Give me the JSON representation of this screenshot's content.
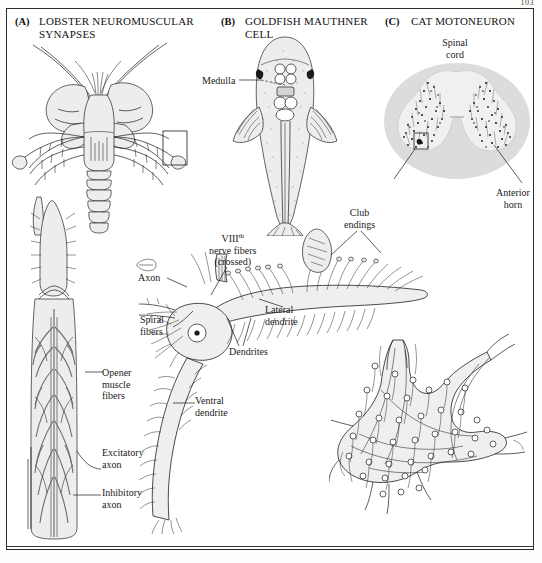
{
  "page": {
    "page_number": "103",
    "background_color": "#ffffff",
    "ink_color": "#1a1a1a"
  },
  "panels": [
    {
      "tag": "(A)",
      "title": "LOBSTER NEUROMUSCULAR\nSYNAPSES",
      "figures": [
        "lobster-dorsal-view",
        "lobster-leg-opener-muscle-detail"
      ],
      "labels": [
        {
          "name": "opener-muscle-fibers",
          "text": "Opener\nmuscle\nfibers"
        },
        {
          "name": "excitatory-axon",
          "text": "Excitatory\naxon"
        },
        {
          "name": "inhibitory-axon",
          "text": "Inhibitory\naxon"
        }
      ]
    },
    {
      "tag": "(B)",
      "title": "GOLDFISH MAUTHNER\nCELL",
      "figures": [
        "goldfish-dorsal-view",
        "mauthner-cell-drawing"
      ],
      "labels": [
        {
          "name": "medulla",
          "text": "Medulla"
        },
        {
          "name": "viii-nerve-fibers",
          "text_pre": "VIII",
          "text_sup": "th",
          "text_post": "\nnerve fibers\n(crossed)"
        },
        {
          "name": "axon",
          "text": "Axon"
        },
        {
          "name": "spiral-fibers",
          "text": "Spiral\nfibers"
        },
        {
          "name": "club-endings",
          "text": "Club\nendings"
        },
        {
          "name": "lateral-dendrite",
          "text": "Lateral\ndendrite"
        },
        {
          "name": "dendrites",
          "text": "Dendrites"
        },
        {
          "name": "ventral-dendrite",
          "text": "Ventral\ndendrite"
        }
      ]
    },
    {
      "tag": "(C)",
      "title": "CAT MOTONEURON",
      "figures": [
        "spinal-cord-cross-section",
        "motoneuron-soma-with-boutons"
      ],
      "labels": [
        {
          "name": "spinal-cord",
          "text": "Spinal\ncord"
        },
        {
          "name": "anterior-horn",
          "text": "Anterior\nhorn"
        }
      ]
    }
  ],
  "label_text": {
    "a_tag": "(A)",
    "a_title": "LOBSTER NEUROMUSCULAR SYNAPSES",
    "a_title_line1": "LOBSTER NEUROMUSCULAR",
    "a_title_line2": "SYNAPSES",
    "b_tag": "(B)",
    "b_title_line1": "GOLDFISH MAUTHNER",
    "b_title_line2": "CELL",
    "c_tag": "(C)",
    "c_title": "CAT MOTONEURON",
    "opener_muscle_fibers": "Opener\nmuscle\nfibers",
    "excitatory_axon": "Excitatory\naxon",
    "inhibitory_axon": "Inhibitory\naxon",
    "medulla": "Medulla",
    "viii_main": "VIII",
    "viii_sup": "th",
    "viii_rest": "nerve fibers\n(crossed)",
    "axon": "Axon",
    "spiral_fibers": "Spiral\nfibers",
    "club_endings": "Club\nendings",
    "lateral_dendrite": "Lateral\ndendrite",
    "dendrites": "Dendrites",
    "ventral_dendrite": "Ventral\ndendrite",
    "spinal_cord": "Spinal\ncord",
    "anterior_horn": "Anterior\nhorn"
  }
}
